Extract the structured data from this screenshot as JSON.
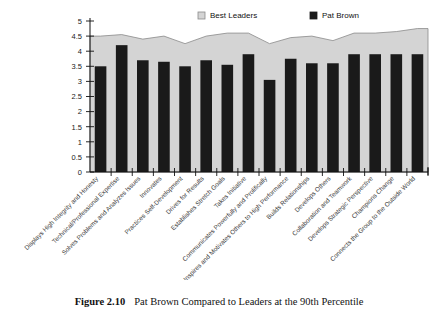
{
  "figure": {
    "number_label": "Figure 2.10",
    "caption": "Pat Brown Compared to Leaders at the 90th Percentile"
  },
  "legend": {
    "position": "top-center",
    "items": [
      {
        "label": "Best Leaders",
        "color": "#d4d4d4",
        "swatch": "light-gray-square"
      },
      {
        "label": "Pat Brown",
        "color": "#1a1a1a",
        "swatch": "black-square"
      }
    ]
  },
  "axes": {
    "y_ticks": [
      "0",
      "0.5",
      "1",
      "1.5",
      "2",
      "2.5",
      "3",
      "3.5",
      "4",
      "4.5",
      "5"
    ]
  },
  "chart_data": {
    "type": "bar",
    "title": "",
    "xlabel": "",
    "ylabel": "",
    "ylim": [
      0,
      5
    ],
    "ytick_step": 0.5,
    "grid": false,
    "legend_position": "top-center",
    "categories": [
      "Displays High Integrity and Honesty",
      "Technical/Professional Expertise",
      "Solves Problems and Analyzes Issues",
      "Innovates",
      "Practices Self-Development",
      "Drives for Results",
      "Establishes Stretch Goals",
      "Takes Initiative",
      "Communicates Powerfully and Prolifically",
      "Inspires and Motivates Others to High Performance",
      "Builds Relationships",
      "Develops Others",
      "Collaboration and Teamwork",
      "Develops Strategic Perspective",
      "Champions Change",
      "Connects the Group to the Outside World"
    ],
    "series": [
      {
        "name": "Best Leaders",
        "type": "area",
        "color": "#d4d4d4",
        "values": [
          4.5,
          4.55,
          4.4,
          4.5,
          4.25,
          4.5,
          4.6,
          4.6,
          4.25,
          4.45,
          4.5,
          4.35,
          4.6,
          4.6,
          4.65,
          4.75
        ]
      },
      {
        "name": "Pat Brown",
        "type": "bar",
        "color": "#1a1a1a",
        "values": [
          3.5,
          4.2,
          3.7,
          3.65,
          3.5,
          3.7,
          3.55,
          3.9,
          3.05,
          3.75,
          3.6,
          3.6,
          3.9,
          3.9,
          3.9,
          3.9
        ]
      }
    ]
  }
}
